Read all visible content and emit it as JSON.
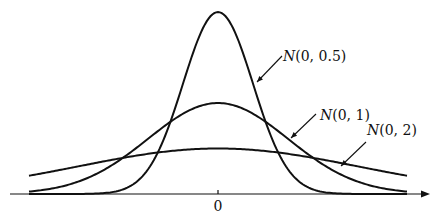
{
  "figure": {
    "type": "normal-distribution-curves",
    "axis": {
      "origin_label": "0",
      "arrow": true
    },
    "curves": [
      {
        "name": "N(0,0.5)",
        "mean": 0,
        "sigma": 0.5,
        "label_N": "N",
        "label_args": "(0, 0.5)",
        "label_x": 283,
        "label_y": 61,
        "leader": [
          282,
          56,
          257,
          82
        ]
      },
      {
        "name": "N(0,1)",
        "mean": 0,
        "sigma": 1,
        "label_N": "N",
        "label_args": "(0, 1)",
        "label_x": 320,
        "label_y": 120,
        "leader": [
          316,
          114,
          291,
          138
        ]
      },
      {
        "name": "N(0,2)",
        "mean": 0,
        "sigma": 2,
        "label_N": "N",
        "label_args": "(0, 2)",
        "label_x": 367,
        "label_y": 135,
        "leader": [
          366,
          142,
          341,
          166
        ]
      }
    ],
    "x_range": [
      -2.7,
      2.7
    ],
    "stroke_color": "#111111"
  }
}
